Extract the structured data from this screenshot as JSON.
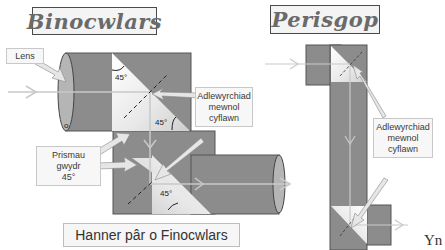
{
  "binoculars": {
    "title": "Binocwlars",
    "labels": {
      "lens": "Lens",
      "tir_line1": "Adlewyrchiad",
      "tir_line2": "mewnol",
      "tir_line3": "cyflawn",
      "prisms_line1": "Prismau",
      "prisms_line2": "gwydr",
      "prisms_line3": "45°"
    },
    "angles": [
      "45°",
      "45°",
      "45°"
    ],
    "caption": "Hanner pâr o Finocwlars"
  },
  "periscope": {
    "title": "Perisgop",
    "labels": {
      "tir_line1": "Adlewyrchiad",
      "tir_line2": "mewnol",
      "tir_line3": "cyflawn"
    }
  },
  "footer_fragment": "Yn",
  "colors": {
    "body_grey": "#8c8c8c",
    "prism_light": "#f0f0f0",
    "ray": "#c9c9c9",
    "arrow_fill": "#e6e6e6",
    "title_text": "#6a6a6a"
  }
}
